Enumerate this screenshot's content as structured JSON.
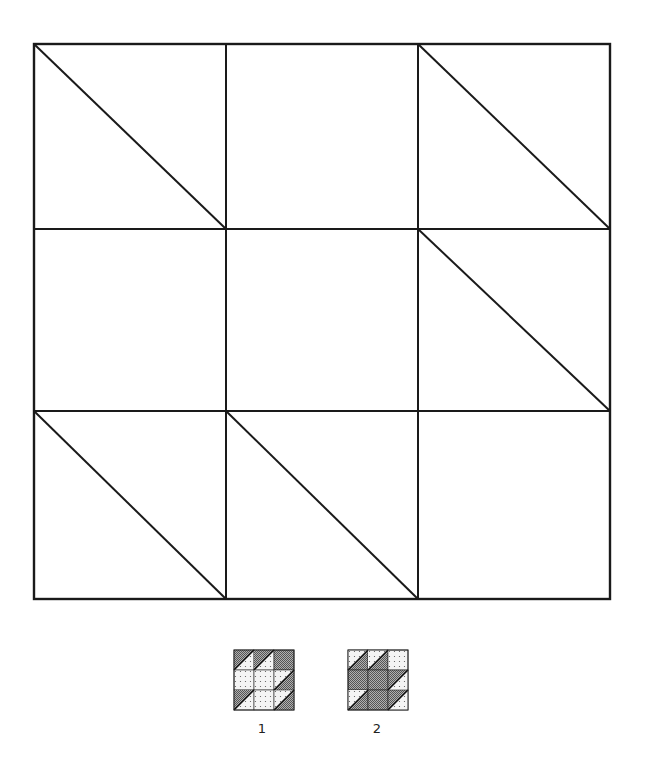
{
  "main_grid": {
    "left": 34,
    "top": 44,
    "right": 610,
    "bottom": 599,
    "col_lines": [
      34,
      226,
      418,
      610
    ],
    "row_lines": [
      44,
      229,
      411,
      599
    ],
    "stroke": "#1a1a1a",
    "diagonal_cells": [
      [
        0,
        0
      ],
      [
        0,
        2
      ],
      [
        1,
        2
      ],
      [
        2,
        0
      ],
      [
        2,
        1
      ]
    ]
  },
  "thumbnails": [
    {
      "label": "1",
      "x": 234,
      "y": 650,
      "size": 60,
      "label_x": 252,
      "label_y": 721,
      "cells": [
        [
          "dark-tl",
          "dark-tl",
          "dark"
        ],
        [
          "light",
          "light",
          "dark-br"
        ],
        [
          "dark-tl",
          "light",
          "dark-br"
        ]
      ]
    },
    {
      "label": "2",
      "x": 348,
      "y": 650,
      "size": 60,
      "label_x": 367,
      "label_y": 721,
      "cells": [
        [
          "light-tl",
          "light-tl",
          "light"
        ],
        [
          "dark",
          "dark",
          "light-br"
        ],
        [
          "light-tl",
          "dark",
          "light-br"
        ]
      ]
    }
  ],
  "colors": {
    "dark_fill": "#8c8c8c",
    "light_fill": "#f4f4f4",
    "line": "#1a1a1a"
  }
}
